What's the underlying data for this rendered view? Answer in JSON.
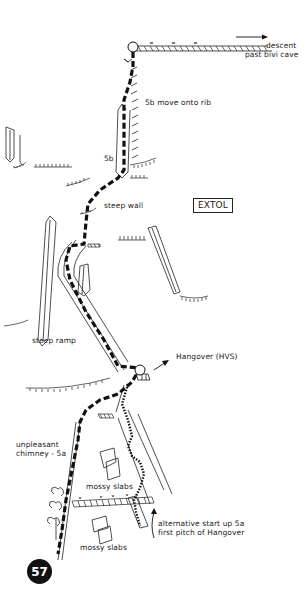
{
  "diagram": {
    "type": "climbing-topo",
    "crag_label": "EXTOL",
    "route_number": "57",
    "colors": {
      "ink": "#111111",
      "background": "#ffffff"
    },
    "labels": {
      "descent_line1": "descent",
      "descent_line2": "past bivi cave",
      "move_onto_rib": "5b move onto rib",
      "crux_grade": "5b",
      "steep_wall": "steep wall",
      "steep_ramp": "steep ramp",
      "hangover": "Hangover (HVS)",
      "chimney_line1": "unpleasant",
      "chimney_line2": "chimney - 5a",
      "mossy_slabs_upper": "mossy slabs",
      "mossy_slabs_lower": "mossy slabs",
      "alt_start_line1": "alternative start up 5a",
      "alt_start_line2": "first pitch of Hangover"
    },
    "symbols": {
      "belay": "belay-circle-icon",
      "tree": "tree-icon",
      "arrow": "arrow-icon",
      "vegetation": "grass-tuft-icon"
    }
  }
}
